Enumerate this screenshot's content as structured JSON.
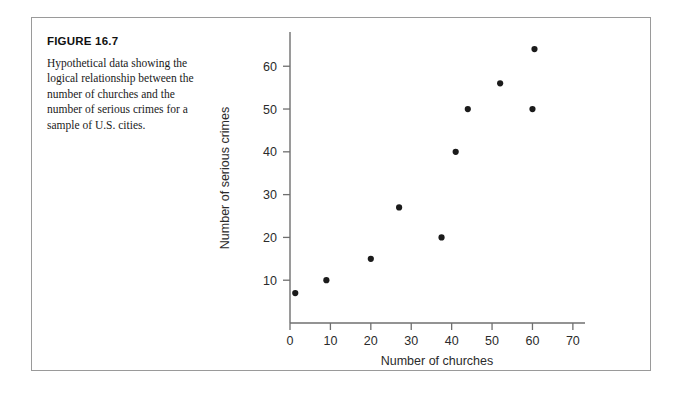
{
  "figure": {
    "number_label": "FIGURE 16.7",
    "caption": "Hypothetical data showing the logical relationship between the number of churches and the number of serious crimes for a sample of U.S. cities."
  },
  "chart_data": {
    "type": "scatter",
    "title": "",
    "xlabel": "Number of churches",
    "ylabel": "Number of serious crimes",
    "xlim": [
      0,
      73
    ],
    "ylim": [
      0,
      68
    ],
    "xticks": [
      0,
      10,
      20,
      30,
      40,
      50,
      60,
      70
    ],
    "xtick_labels": [
      "0",
      "10",
      "20",
      "30",
      "40",
      "50",
      "60",
      "70"
    ],
    "yticks": [
      10,
      20,
      30,
      40,
      50,
      60
    ],
    "ytick_labels": [
      "10",
      "20",
      "30",
      "40",
      "50",
      "60"
    ],
    "grid": false,
    "legend": false,
    "marker": "filled-circle",
    "marker_color": "#1b1b1b",
    "points": [
      {
        "x": 1.3,
        "y": 7
      },
      {
        "x": 9,
        "y": 10
      },
      {
        "x": 20,
        "y": 15
      },
      {
        "x": 27,
        "y": 27
      },
      {
        "x": 37.5,
        "y": 20
      },
      {
        "x": 41,
        "y": 40
      },
      {
        "x": 44,
        "y": 50
      },
      {
        "x": 52,
        "y": 56
      },
      {
        "x": 60,
        "y": 50
      },
      {
        "x": 60.5,
        "y": 64
      }
    ]
  },
  "colors": {
    "panel_border": "#9a9a9a",
    "axis": "#6f6f6f",
    "text": "#1a1a1a",
    "marker": "#1b1b1b"
  }
}
